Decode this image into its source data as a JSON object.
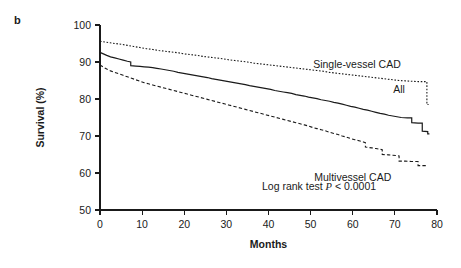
{
  "figure": {
    "panel_label": "b"
  },
  "chart_data": {
    "type": "line",
    "subtype": "kaplan-meier-survival",
    "title": "",
    "xlabel": "Months",
    "ylabel": "Survival (%)",
    "xlim": [
      0,
      80
    ],
    "ylim": [
      50,
      100
    ],
    "xticks": [
      0,
      10,
      20,
      30,
      40,
      50,
      60,
      70,
      80
    ],
    "xtick_labels": [
      "0",
      "10",
      "20",
      "30",
      "40",
      "50",
      "60",
      "70",
      "80"
    ],
    "yticks": [
      50,
      60,
      70,
      80,
      90,
      100
    ],
    "ytick_labels": [
      "50",
      "60",
      "70",
      "80",
      "90",
      "100"
    ],
    "grid": false,
    "legend_position": "inline-right",
    "annotations": [
      {
        "name": "log-rank-annotation",
        "text_before": "Log rank test ",
        "text_italic": "P",
        "text_after": " < 0.0001",
        "x_months": 52,
        "y_percent": 55.5
      }
    ],
    "series": [
      {
        "name": "Single-vessel CAD",
        "label": "Single-vessel CAD",
        "style": "dotted",
        "color": "#1a1a1a",
        "label_x_months": 61,
        "label_y_percent": 88.5,
        "points": [
          [
            0,
            95.6
          ],
          [
            1.2,
            95.4
          ],
          [
            2.4,
            95.2
          ],
          [
            3.6,
            95.0
          ],
          [
            5.0,
            94.8
          ],
          [
            6.5,
            94.5
          ],
          [
            8.0,
            94.2
          ],
          [
            9.5,
            93.9
          ],
          [
            11.0,
            93.6
          ],
          [
            12.5,
            93.4
          ],
          [
            14.0,
            93.1
          ],
          [
            15.5,
            92.9
          ],
          [
            17.0,
            92.7
          ],
          [
            18.5,
            92.5
          ],
          [
            20.0,
            92.2
          ],
          [
            21.5,
            92.0
          ],
          [
            23.0,
            91.8
          ],
          [
            24.5,
            91.5
          ],
          [
            26.0,
            91.3
          ],
          [
            27.5,
            91.1
          ],
          [
            29.0,
            90.9
          ],
          [
            30.5,
            90.6
          ],
          [
            32.0,
            90.4
          ],
          [
            33.5,
            90.2
          ],
          [
            35.0,
            90.0
          ],
          [
            36.5,
            89.7
          ],
          [
            38.0,
            89.5
          ],
          [
            39.5,
            89.3
          ],
          [
            41.0,
            89.1
          ],
          [
            42.5,
            88.9
          ],
          [
            44.0,
            88.7
          ],
          [
            45.5,
            88.5
          ],
          [
            47.0,
            88.3
          ],
          [
            48.5,
            88.1
          ],
          [
            50.0,
            87.9
          ],
          [
            51.5,
            87.7
          ],
          [
            53.0,
            87.5
          ],
          [
            54.5,
            87.2
          ],
          [
            56.0,
            87.0
          ],
          [
            57.5,
            86.8
          ],
          [
            59.0,
            86.6
          ],
          [
            60.5,
            86.4
          ],
          [
            62.0,
            86.2
          ],
          [
            63.5,
            86.0
          ],
          [
            65.0,
            85.8
          ],
          [
            66.5,
            85.6
          ],
          [
            68.0,
            85.4
          ],
          [
            69.5,
            85.2
          ],
          [
            71.0,
            85.0
          ],
          [
            72.5,
            84.9
          ],
          [
            74.0,
            84.8
          ],
          [
            75.5,
            84.7
          ],
          [
            77.0,
            84.7
          ],
          [
            77.6,
            84.7
          ],
          [
            77.6,
            78.5
          ],
          [
            78.0,
            78.5
          ]
        ]
      },
      {
        "name": "All",
        "label": "All",
        "style": "solid",
        "color": "#1a1a1a",
        "label_x_months": 71,
        "label_y_percent": 81.5,
        "points": [
          [
            0,
            92.6
          ],
          [
            0.8,
            92.2
          ],
          [
            1.6,
            91.8
          ],
          [
            2.5,
            91.4
          ],
          [
            3.5,
            91.1
          ],
          [
            4.5,
            90.8
          ],
          [
            5.5,
            90.5
          ],
          [
            6.5,
            90.2
          ],
          [
            7.3,
            90.0
          ],
          [
            7.3,
            89.0
          ],
          [
            8.5,
            88.9
          ],
          [
            9.5,
            88.8
          ],
          [
            10.5,
            88.7
          ],
          [
            11.5,
            88.6
          ],
          [
            12.5,
            88.5
          ],
          [
            13.5,
            88.3
          ],
          [
            14.5,
            88.1
          ],
          [
            15.5,
            87.9
          ],
          [
            16.5,
            87.7
          ],
          [
            17.5,
            87.5
          ],
          [
            18.5,
            87.2
          ],
          [
            19.5,
            87.0
          ],
          [
            20.5,
            86.8
          ],
          [
            21.5,
            86.6
          ],
          [
            22.5,
            86.4
          ],
          [
            23.5,
            86.2
          ],
          [
            24.5,
            86.0
          ],
          [
            25.5,
            85.8
          ],
          [
            26.5,
            85.5
          ],
          [
            27.5,
            85.3
          ],
          [
            28.5,
            85.1
          ],
          [
            29.5,
            84.9
          ],
          [
            30.5,
            84.7
          ],
          [
            31.5,
            84.5
          ],
          [
            32.5,
            84.3
          ],
          [
            33.5,
            84.1
          ],
          [
            34.5,
            83.9
          ],
          [
            35.5,
            83.6
          ],
          [
            36.5,
            83.4
          ],
          [
            37.5,
            83.2
          ],
          [
            38.5,
            83.0
          ],
          [
            39.5,
            82.8
          ],
          [
            40.5,
            82.6
          ],
          [
            41.5,
            82.3
          ],
          [
            42.5,
            82.1
          ],
          [
            43.5,
            81.9
          ],
          [
            44.5,
            81.7
          ],
          [
            45.5,
            81.5
          ],
          [
            46.5,
            81.2
          ],
          [
            47.5,
            81.0
          ],
          [
            48.5,
            80.8
          ],
          [
            49.5,
            80.5
          ],
          [
            50.5,
            80.3
          ],
          [
            51.5,
            80.1
          ],
          [
            52.5,
            79.8
          ],
          [
            53.5,
            79.6
          ],
          [
            54.5,
            79.4
          ],
          [
            55.5,
            79.1
          ],
          [
            56.5,
            78.9
          ],
          [
            57.5,
            78.6
          ],
          [
            58.5,
            78.3
          ],
          [
            59.5,
            78.0
          ],
          [
            60.5,
            77.8
          ],
          [
            61.5,
            77.5
          ],
          [
            62.5,
            77.2
          ],
          [
            63.5,
            77.0
          ],
          [
            64.5,
            76.7
          ],
          [
            65.5,
            76.4
          ],
          [
            66.5,
            76.1
          ],
          [
            67.5,
            75.9
          ],
          [
            68.5,
            75.6
          ],
          [
            69.5,
            75.4
          ],
          [
            70.5,
            75.2
          ],
          [
            71.5,
            75.0
          ],
          [
            73.0,
            74.9
          ],
          [
            74.0,
            74.9
          ],
          [
            74.0,
            73.6
          ],
          [
            75.5,
            73.5
          ],
          [
            76.5,
            73.5
          ],
          [
            76.5,
            71.3
          ],
          [
            77.8,
            71.2
          ],
          [
            77.8,
            70.6
          ],
          [
            78.2,
            70.6
          ]
        ]
      },
      {
        "name": "Multivessel CAD",
        "label": "Multivessel CAD",
        "style": "dashed",
        "color": "#1a1a1a",
        "label_x_months": 60,
        "label_y_percent": 57.8,
        "points": [
          [
            0,
            89.2
          ],
          [
            0.8,
            88.6
          ],
          [
            1.6,
            88.1
          ],
          [
            2.5,
            87.6
          ],
          [
            3.5,
            87.2
          ],
          [
            4.5,
            86.8
          ],
          [
            5.5,
            86.4
          ],
          [
            6.5,
            86.0
          ],
          [
            7.5,
            85.6
          ],
          [
            8.5,
            85.2
          ],
          [
            9.5,
            84.8
          ],
          [
            10.5,
            84.4
          ],
          [
            11.5,
            84.1
          ],
          [
            12.5,
            83.8
          ],
          [
            13.5,
            83.5
          ],
          [
            14.5,
            83.2
          ],
          [
            15.5,
            82.9
          ],
          [
            16.5,
            82.6
          ],
          [
            17.5,
            82.3
          ],
          [
            18.5,
            82.0
          ],
          [
            19.5,
            81.7
          ],
          [
            20.5,
            81.4
          ],
          [
            21.5,
            81.1
          ],
          [
            22.5,
            80.8
          ],
          [
            23.5,
            80.5
          ],
          [
            24.5,
            80.2
          ],
          [
            25.5,
            79.9
          ],
          [
            26.5,
            79.6
          ],
          [
            27.5,
            79.3
          ],
          [
            28.5,
            79.0
          ],
          [
            29.5,
            78.7
          ],
          [
            30.5,
            78.4
          ],
          [
            31.5,
            78.1
          ],
          [
            32.5,
            77.8
          ],
          [
            33.5,
            77.5
          ],
          [
            34.5,
            77.2
          ],
          [
            35.5,
            76.9
          ],
          [
            36.5,
            76.6
          ],
          [
            37.5,
            76.3
          ],
          [
            38.5,
            76.0
          ],
          [
            39.5,
            75.7
          ],
          [
            40.5,
            75.4
          ],
          [
            41.5,
            75.1
          ],
          [
            42.5,
            74.8
          ],
          [
            43.5,
            74.5
          ],
          [
            44.5,
            74.2
          ],
          [
            45.5,
            73.9
          ],
          [
            46.5,
            73.6
          ],
          [
            47.5,
            73.3
          ],
          [
            48.5,
            73.0
          ],
          [
            49.5,
            72.7
          ],
          [
            50.5,
            72.3
          ],
          [
            51.5,
            72.0
          ],
          [
            52.5,
            71.7
          ],
          [
            53.5,
            71.4
          ],
          [
            54.5,
            71.0
          ],
          [
            55.5,
            70.7
          ],
          [
            56.5,
            70.4
          ],
          [
            57.5,
            70.0
          ],
          [
            58.5,
            69.7
          ],
          [
            59.5,
            69.3
          ],
          [
            60.5,
            69.0
          ],
          [
            61.5,
            68.7
          ],
          [
            62.5,
            68.4
          ],
          [
            63.0,
            68.2
          ],
          [
            63.0,
            67.0
          ],
          [
            64.5,
            66.8
          ],
          [
            65.5,
            66.6
          ],
          [
            66.5,
            66.4
          ],
          [
            67.0,
            66.3
          ],
          [
            67.0,
            65.0
          ],
          [
            68.5,
            64.9
          ],
          [
            69.5,
            64.8
          ],
          [
            70.5,
            64.7
          ],
          [
            71.0,
            64.6
          ],
          [
            71.0,
            63.2
          ],
          [
            72.5,
            63.2
          ],
          [
            74.0,
            63.1
          ],
          [
            75.5,
            63.1
          ],
          [
            75.5,
            62.0
          ],
          [
            76.5,
            62.0
          ],
          [
            77.5,
            62.0
          ]
        ]
      }
    ]
  }
}
